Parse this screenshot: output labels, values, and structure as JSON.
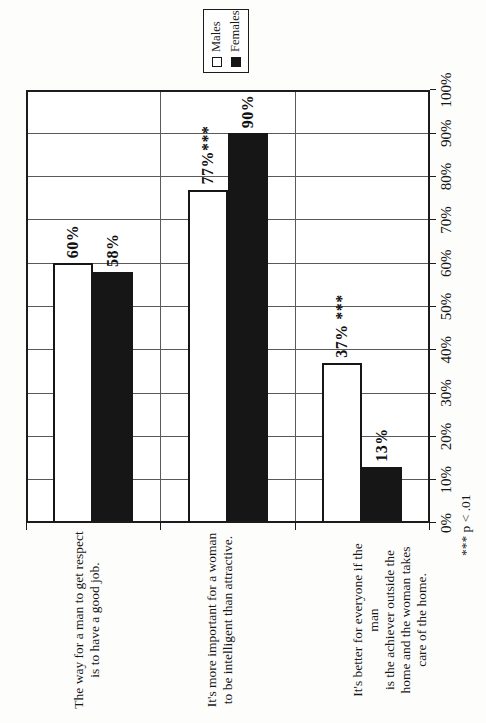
{
  "chart_data": {
    "type": "bar",
    "orientation": "horizontal bars, whole chart rotated 90deg counterclockwise on the page",
    "categories": [
      {
        "lines": [
          "The way for a man to get respect",
          "is to have a good job."
        ]
      },
      {
        "lines": [
          "It's more important for a woman",
          "to be intelligent than attractive."
        ]
      },
      {
        "lines": [
          "It's better for everyone if the man",
          "is the achiever outside the",
          "home and the woman takes",
          "care of the home."
        ]
      }
    ],
    "series": [
      {
        "name": "Males",
        "fill": "#ffffff",
        "values": [
          60,
          77,
          37
        ],
        "labels": [
          "60%",
          "77%***",
          "37% ***"
        ]
      },
      {
        "name": "Females",
        "fill": "#161616",
        "values": [
          58,
          90,
          13
        ],
        "labels": [
          "58%",
          "90%",
          "13%"
        ]
      }
    ],
    "value_axis": {
      "min": 0,
      "max": 100,
      "tick_labels": [
        "0%",
        "10%",
        "20%",
        "30%",
        "40%",
        "50%",
        "60%",
        "70%",
        "80%",
        "90%",
        "100%"
      ]
    },
    "legend": {
      "position": "outside plot, past 100% axis end",
      "entries": [
        "Males",
        "Females"
      ]
    },
    "footnote": "*** p < .01",
    "grid": {
      "value_gridlines": true,
      "category_gridlines": true,
      "legend_border": true
    }
  },
  "colors": {
    "background": "#fdfdfc",
    "plot_background": "#ffffff",
    "ink": "#161616",
    "gridline": "#5a5a5a",
    "males_fill": "#ffffff",
    "females_fill": "#161616"
  }
}
